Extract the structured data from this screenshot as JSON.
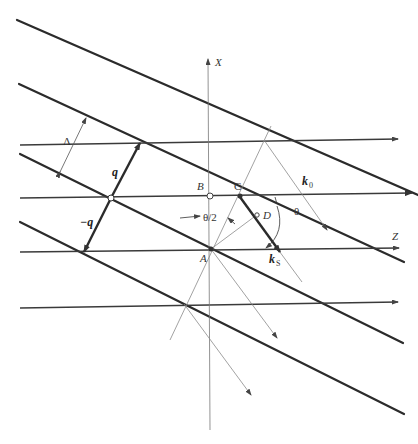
{
  "figure": {
    "labels": {
      "x_axis": "X",
      "z_axis": "Z",
      "lambda": "Λ",
      "q": "q",
      "minus_q": "−q",
      "point_a": "A",
      "point_b": "B",
      "point_c": "C",
      "point_d": "D",
      "k0": "k",
      "k0_sub": "0",
      "ks": "k",
      "ks_sub": "S",
      "half_theta": "θ/2",
      "theta": "θ"
    }
  }
}
